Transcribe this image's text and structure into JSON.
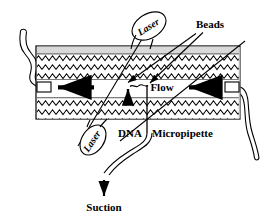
{
  "figure": {
    "background_color": "#ffffff",
    "line_color": "#000000",
    "chamber_fill": "#ffffff",
    "chamber_top_band_color": "#d9d9d9",
    "hatch_color": "#000000"
  },
  "labels": {
    "laser_top": "Laser",
    "laser_bottom": "Laser",
    "beads": "Beads",
    "flow": "Flow",
    "dna": "DNA",
    "micropipette": "Micropipette",
    "suction": "Suction"
  },
  "elements": {
    "chamber": "flow-chamber-body",
    "channel": "central-flow-channel",
    "left_port": "left-chamber-port",
    "right_port": "right-chamber-port",
    "left_tube": "left-inlet-tube",
    "right_tube": "right-outlet-tube",
    "laser_beam": "laser-beam-line",
    "bead_leader_1": "bead-leader-line-left",
    "bead_leader_2": "bead-leader-line-right",
    "flow_arrow_left": "flow-arrow-left",
    "flow_arrow_right": "flow-arrow-right",
    "dna_arrow": "dna-pointer-arrow",
    "suction_arrow": "suction-arrow",
    "micropipette_stem": "micropipette-stem",
    "suction_tube": "suction-tube"
  }
}
